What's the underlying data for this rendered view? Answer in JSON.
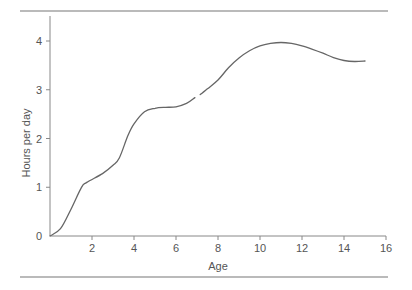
{
  "chart_data": {
    "type": "line",
    "title": "",
    "xlabel": "Age",
    "ylabel": "Hours per day",
    "xlim": [
      0,
      16
    ],
    "ylim": [
      0,
      4.4
    ],
    "x_ticks": [
      2,
      4,
      6,
      8,
      10,
      12,
      14,
      16
    ],
    "y_ticks": [
      0,
      1,
      2,
      3,
      4
    ],
    "grid": false,
    "legend": null,
    "series": [
      {
        "name": "Hours per day",
        "color": "#666666",
        "segments": [
          {
            "x": [
              0,
              0.5,
              1.0,
              1.5,
              1.75,
              2.5,
              3.0,
              3.3,
              3.7,
              4.0,
              4.5,
              5.0,
              5.5,
              6.0,
              6.5,
              6.9
            ],
            "y": [
              0,
              0.15,
              0.55,
              1.0,
              1.1,
              1.28,
              1.45,
              1.6,
              2.05,
              2.3,
              2.55,
              2.62,
              2.64,
              2.65,
              2.72,
              2.84
            ]
          },
          {
            "x": [
              7.15,
              7.5,
              8.0,
              8.5,
              9.0,
              9.5,
              10.0,
              10.5,
              11.0,
              11.5,
              12.0,
              12.5,
              13.0,
              13.5,
              14.0,
              14.5,
              15.0
            ],
            "y": [
              2.9,
              3.02,
              3.2,
              3.45,
              3.65,
              3.8,
              3.9,
              3.95,
              3.97,
              3.95,
              3.9,
              3.83,
              3.75,
              3.66,
              3.6,
              3.58,
              3.59
            ]
          }
        ]
      }
    ]
  }
}
